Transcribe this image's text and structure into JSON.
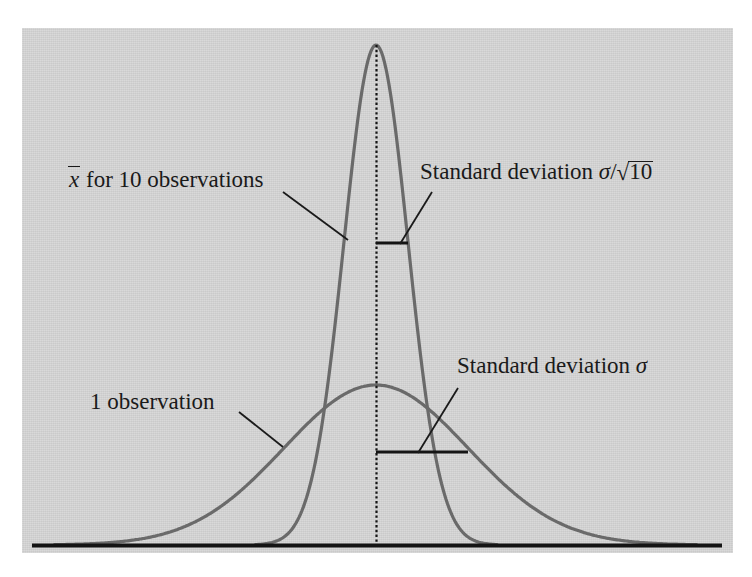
{
  "figure": {
    "background_color": "#ffffff",
    "panel_color": "#d6d6d6",
    "curve_color": "#6a6a6a",
    "axis_color": "#141414",
    "text_color": "#1a1a1a"
  },
  "labels": {
    "xbar_symbol": "x",
    "xbar_rest": " for 10 observations",
    "one_observation": "1 observation",
    "sd_sqrt_prefix": "Standard deviation ",
    "sd_sqrt_sigma": "σ",
    "sd_sqrt_slash": "/",
    "sd_sqrt_radical": "√",
    "sd_sqrt_arg": "10",
    "sd_prefix": "Standard deviation ",
    "sd_sigma": "σ"
  },
  "chart_data": {
    "type": "line",
    "title": "",
    "xlabel": "",
    "ylabel": "",
    "grid": false,
    "legend": "inline-annotations",
    "axis": {
      "baseline_y": 545,
      "x_start": 32,
      "x_end": 722
    },
    "center_line": {
      "x": 376,
      "style": "dotted",
      "y_top": 45,
      "y_bottom": 545
    },
    "series": [
      {
        "name": "1 observation",
        "distribution": "normal",
        "mean_px": 376,
        "sigma_px": 92,
        "peak_y_px": 385,
        "amplitude_px": 160,
        "color": "#6a6a6a",
        "annotation": "1 observation",
        "sd_marker": {
          "label": "Standard deviation σ",
          "y_px": 452,
          "x_from": 376,
          "x_to": 468,
          "width_px": 92
        }
      },
      {
        "name": "x̄ for 10 observations",
        "distribution": "normal",
        "mean_px": 376,
        "sigma_px": 32,
        "peak_y_px": 45,
        "amplitude_px": 500,
        "color": "#6a6a6a",
        "annotation": "x̄ for 10 observations",
        "sd_marker": {
          "label": "Standard deviation σ/√10",
          "y_px": 243,
          "x_from": 376,
          "x_to": 408,
          "width_px": 32
        }
      }
    ],
    "note": "Sampling distribution of the sample mean of 10 observations is 1/sqrt(10) as wide as the distribution of a single observation; both are centred on the same mean."
  }
}
